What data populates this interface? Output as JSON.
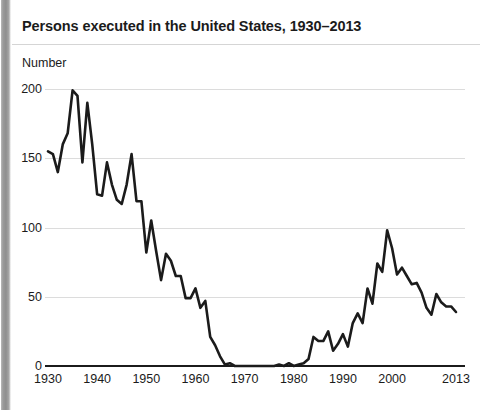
{
  "title": "Persons executed in the United States, 1930–2013",
  "axis": {
    "ylabel": "Number"
  },
  "chart_data": {
    "type": "line",
    "title": "Persons executed in the United States, 1930–2013",
    "xlabel": "",
    "ylabel": "Number",
    "xlim": [
      1930,
      2013
    ],
    "ylim": [
      0,
      200
    ],
    "yticks": [
      0,
      50,
      100,
      150,
      200
    ],
    "xticks": [
      1930,
      1940,
      1950,
      1960,
      1970,
      1980,
      1990,
      2000,
      2013
    ],
    "grid": true,
    "legend": "none",
    "line_color": "#1b1b1b",
    "line_width": 2.6,
    "x": [
      1930,
      1931,
      1932,
      1933,
      1934,
      1935,
      1936,
      1937,
      1938,
      1939,
      1940,
      1941,
      1942,
      1943,
      1944,
      1945,
      1946,
      1947,
      1948,
      1949,
      1950,
      1951,
      1952,
      1953,
      1954,
      1955,
      1956,
      1957,
      1958,
      1959,
      1960,
      1961,
      1962,
      1963,
      1964,
      1965,
      1966,
      1967,
      1968,
      1969,
      1970,
      1971,
      1972,
      1973,
      1974,
      1975,
      1976,
      1977,
      1978,
      1979,
      1980,
      1981,
      1982,
      1983,
      1984,
      1985,
      1986,
      1987,
      1988,
      1989,
      1990,
      1991,
      1992,
      1993,
      1994,
      1995,
      1996,
      1997,
      1998,
      1999,
      2000,
      2001,
      2002,
      2003,
      2004,
      2005,
      2006,
      2007,
      2008,
      2009,
      2010,
      2011,
      2012,
      2013
    ],
    "values": [
      155,
      153,
      140,
      160,
      168,
      199,
      195,
      147,
      190,
      160,
      124,
      123,
      147,
      131,
      120,
      117,
      131,
      153,
      119,
      119,
      82,
      105,
      83,
      62,
      81,
      76,
      65,
      65,
      49,
      49,
      56,
      42,
      47,
      21,
      15,
      7,
      1,
      2,
      0,
      0,
      0,
      0,
      0,
      0,
      0,
      0,
      0,
      1,
      0,
      2,
      0,
      1,
      2,
      5,
      21,
      18,
      18,
      25,
      11,
      16,
      23,
      14,
      31,
      38,
      31,
      56,
      45,
      74,
      68,
      98,
      85,
      66,
      71,
      65,
      59,
      60,
      53,
      42,
      37,
      52,
      46,
      43,
      43,
      39
    ],
    "series": [
      {
        "name": "Persons executed",
        "values": [
          155,
          153,
          140,
          160,
          168,
          199,
          195,
          147,
          190,
          160,
          124,
          123,
          147,
          131,
          120,
          117,
          131,
          153,
          119,
          119,
          82,
          105,
          83,
          62,
          81,
          76,
          65,
          65,
          49,
          49,
          56,
          42,
          47,
          21,
          15,
          7,
          1,
          2,
          0,
          0,
          0,
          0,
          0,
          0,
          0,
          0,
          0,
          1,
          0,
          2,
          0,
          1,
          2,
          5,
          21,
          18,
          18,
          25,
          11,
          16,
          23,
          14,
          31,
          38,
          31,
          56,
          45,
          74,
          68,
          98,
          85,
          66,
          71,
          65,
          59,
          60,
          53,
          42,
          37,
          52,
          46,
          43,
          43,
          39
        ]
      }
    ]
  }
}
